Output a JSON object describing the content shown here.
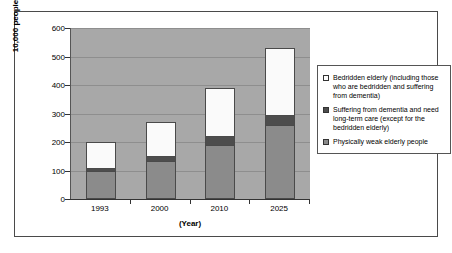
{
  "chart_data": {
    "type": "bar",
    "subtype": "stacked-vertical",
    "title": "",
    "xlabel": "(Year)",
    "ylabel": "10,000 people",
    "categories": [
      "1993",
      "2000",
      "2010",
      "2025"
    ],
    "ylim": [
      0,
      600
    ],
    "yticks": [
      0,
      100,
      200,
      300,
      400,
      500,
      600
    ],
    "ytick_labels": [
      "0",
      "100",
      "200",
      "300",
      "400",
      "500",
      "600"
    ],
    "grid": true,
    "grid_axis": "y",
    "legend_position": "right",
    "stack_order_bottom_to_top": [
      "Physically weak elderly people",
      "Suffering from dementia and need long-term care (except for the bedridden elderly)",
      "Bedridden elderly (including those who are bedridden and suffering from dementia)"
    ],
    "series": [
      {
        "name": "Physically weak elderly people",
        "color": "#8b8b8b",
        "values": [
          100,
          135,
          190,
          260
        ]
      },
      {
        "name": "Suffering from dementia and need long-term care (except for the bedridden elderly)",
        "color": "#4d4d4d",
        "values": [
          10,
          15,
          30,
          35
        ]
      },
      {
        "name": "Bedridden elderly (including those who are bedridden and suffering from dementia)",
        "color": "#fafafa",
        "values": [
          90,
          120,
          170,
          235
        ]
      }
    ],
    "totals": [
      200,
      270,
      390,
      530
    ],
    "plot_background": "#a8a8a8"
  },
  "legend": {
    "items": [
      {
        "swatch": "white-swatch",
        "label": "Bedridden elderly (including those who are bedridden and suffering from dementia)"
      },
      {
        "swatch": "dark-gray-swatch",
        "label": "Suffering from dementia and need long-term care (except for the bedridden elderly)"
      },
      {
        "swatch": "medium-gray-swatch",
        "label": "Physically weak elderly people"
      }
    ]
  }
}
